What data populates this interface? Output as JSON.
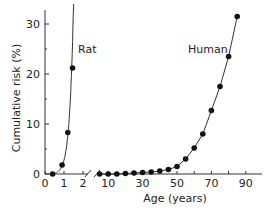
{
  "chart_data": {
    "type": "line",
    "title": "",
    "ylabel": "Cumulative risk (%)",
    "xlabel": "Age (years)",
    "ylim": [
      0,
      33
    ],
    "y_ticks": [
      0,
      10,
      20,
      30
    ],
    "axis_break": true,
    "segments": [
      {
        "name": "Rat",
        "x_ticks": [
          0,
          1,
          2
        ],
        "xlim": [
          0,
          2.3
        ]
      },
      {
        "name": "Human",
        "x_ticks": [
          10,
          30,
          50,
          70,
          90
        ],
        "xlim": [
          3,
          100
        ]
      }
    ],
    "series": [
      {
        "name": "Rat",
        "label": "Rat",
        "x": [
          0.4,
          0.9,
          1.2,
          1.45
        ],
        "y": [
          0,
          1.8,
          8.3,
          21.2
        ]
      },
      {
        "name": "Human",
        "label": "Human",
        "x": [
          5,
          10,
          15,
          20,
          25,
          30,
          35,
          40,
          45,
          50,
          55,
          60,
          65,
          70,
          75,
          80,
          85
        ],
        "y": [
          0,
          0,
          0,
          0.1,
          0.2,
          0.3,
          0.4,
          0.6,
          0.9,
          1.5,
          3.0,
          5.2,
          8.0,
          12.7,
          17.5,
          23.5,
          31.5
        ]
      }
    ],
    "grid": false,
    "legend": "inline labels"
  }
}
